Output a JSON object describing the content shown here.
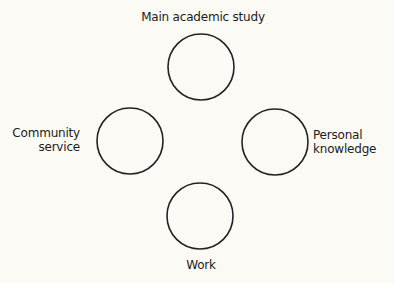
{
  "diagram": {
    "type": "four-circle layout",
    "stroke_color": "#222222",
    "background_color": "#fbfaf5",
    "nodes": [
      {
        "id": "top",
        "label_lines": [
          "Main academic study"
        ],
        "position": "top"
      },
      {
        "id": "left",
        "label_lines": [
          "Community",
          "service"
        ],
        "position": "left"
      },
      {
        "id": "right",
        "label_lines": [
          "Personal",
          "knowledge"
        ],
        "position": "right"
      },
      {
        "id": "bottom",
        "label_lines": [
          "Work"
        ],
        "position": "bottom"
      }
    ]
  }
}
